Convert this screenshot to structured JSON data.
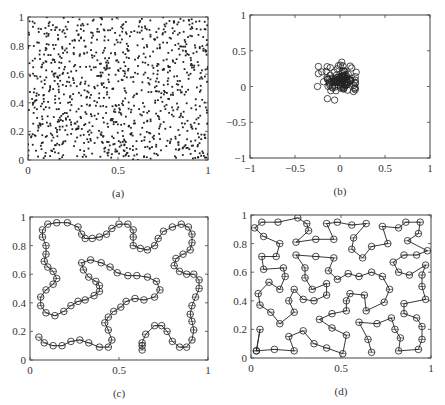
{
  "figure": {
    "background": "#ffffff",
    "ink": "#222222"
  },
  "chart_data": [
    {
      "id": "a",
      "type": "scatter",
      "caption": "(a)",
      "title": "",
      "xlabel": "",
      "ylabel": "",
      "xlim": [
        0,
        1
      ],
      "ylim": [
        0,
        1
      ],
      "xticks": [
        0,
        0.5,
        1
      ],
      "xtick_labels": [
        "0",
        "0.5",
        "1"
      ],
      "yticks": [
        0,
        0.2,
        0.4,
        0.6,
        0.8,
        1
      ],
      "ytick_labels": [
        "0",
        "0.2",
        "0.4",
        "0.6",
        "0.8",
        "1"
      ],
      "grid": false,
      "marker": "dot",
      "description": "Approximately 1000 points uniformly distributed over the unit square",
      "generator": {
        "kind": "uniform",
        "n": 1000,
        "seed": 7,
        "x_range": [
          0,
          1
        ],
        "y_range": [
          0,
          1
        ]
      },
      "frame": {
        "left": 28,
        "top": 17,
        "right": 208,
        "bottom": 160
      }
    },
    {
      "id": "b",
      "type": "scatter",
      "caption": "(b)",
      "title": "",
      "xlabel": "",
      "ylabel": "",
      "xlim": [
        -1,
        1
      ],
      "ylim": [
        -1,
        1
      ],
      "xticks": [
        -1,
        -0.5,
        0,
        0.5,
        1
      ],
      "xtick_labels": [
        "−1",
        "−0.5",
        "0",
        "0.5",
        "1"
      ],
      "yticks": [
        -1,
        -0.5,
        0,
        0.5,
        1
      ],
      "ytick_labels": [
        "−1",
        "−0.5",
        "0",
        "0.5",
        "1"
      ],
      "grid": false,
      "marker": "open-circle",
      "description": "About 100 open-circle points clustered near the origin within radius ~0.3",
      "generator": {
        "kind": "gaussian",
        "n": 100,
        "seed": 3,
        "center": [
          0.0,
          0.08
        ],
        "sigma": 0.09
      },
      "outliers": [
        [
          -0.24,
          0.28
        ],
        [
          -0.24,
          0.18
        ],
        [
          -0.25,
          0.0
        ],
        [
          -0.14,
          -0.17
        ],
        [
          -0.06,
          -0.19
        ],
        [
          0.02,
          0.34
        ],
        [
          0.18,
          0.2
        ],
        [
          0.15,
          -0.07
        ],
        [
          0.13,
          0.26
        ]
      ],
      "frame": {
        "left": 250,
        "top": 15,
        "right": 430,
        "bottom": 158
      }
    },
    {
      "id": "c",
      "type": "line",
      "caption": "(c)",
      "title": "",
      "xlabel": "",
      "ylabel": "",
      "xlim": [
        0,
        1
      ],
      "ylim": [
        0,
        1
      ],
      "xticks": [
        0,
        0.5,
        1
      ],
      "xtick_labels": [
        "0",
        "0.5",
        "1"
      ],
      "yticks": [
        0,
        0.2,
        0.4,
        0.6,
        0.8,
        1
      ],
      "ytick_labels": [
        "0",
        "0.2",
        "0.4",
        "0.6",
        "0.8",
        "1"
      ],
      "grid": false,
      "marker": "open-circle",
      "description": "Single open path (elastic ring / chain) of about 100 nodes winding through the unit square",
      "series": [
        {
          "name": "path",
          "points": [
            [
              0.63,
              0.07
            ],
            [
              0.63,
              0.1
            ],
            [
              0.63,
              0.12
            ],
            [
              0.65,
              0.18
            ],
            [
              0.7,
              0.24
            ],
            [
              0.74,
              0.24
            ],
            [
              0.77,
              0.2
            ],
            [
              0.8,
              0.13
            ],
            [
              0.84,
              0.09
            ],
            [
              0.88,
              0.09
            ],
            [
              0.91,
              0.14
            ],
            [
              0.92,
              0.21
            ],
            [
              0.91,
              0.27
            ],
            [
              0.9,
              0.32
            ],
            [
              0.91,
              0.38
            ],
            [
              0.93,
              0.44
            ],
            [
              0.95,
              0.5
            ],
            [
              0.95,
              0.56
            ],
            [
              0.92,
              0.6
            ],
            [
              0.88,
              0.6
            ],
            [
              0.84,
              0.62
            ],
            [
              0.81,
              0.66
            ],
            [
              0.82,
              0.71
            ],
            [
              0.86,
              0.74
            ],
            [
              0.9,
              0.77
            ],
            [
              0.91,
              0.82
            ],
            [
              0.91,
              0.88
            ],
            [
              0.89,
              0.93
            ],
            [
              0.85,
              0.95
            ],
            [
              0.8,
              0.93
            ],
            [
              0.75,
              0.9
            ],
            [
              0.72,
              0.85
            ],
            [
              0.7,
              0.8
            ],
            [
              0.66,
              0.77
            ],
            [
              0.62,
              0.78
            ],
            [
              0.58,
              0.8
            ],
            [
              0.58,
              0.86
            ],
            [
              0.58,
              0.91
            ],
            [
              0.55,
              0.95
            ],
            [
              0.5,
              0.95
            ],
            [
              0.46,
              0.92
            ],
            [
              0.43,
              0.88
            ],
            [
              0.39,
              0.86
            ],
            [
              0.35,
              0.85
            ],
            [
              0.31,
              0.85
            ],
            [
              0.29,
              0.88
            ],
            [
              0.27,
              0.93
            ],
            [
              0.21,
              0.96
            ],
            [
              0.15,
              0.96
            ],
            [
              0.1,
              0.95
            ],
            [
              0.07,
              0.91
            ],
            [
              0.07,
              0.86
            ],
            [
              0.09,
              0.8
            ],
            [
              0.09,
              0.74
            ],
            [
              0.08,
              0.69
            ],
            [
              0.1,
              0.65
            ],
            [
              0.13,
              0.62
            ],
            [
              0.15,
              0.57
            ],
            [
              0.13,
              0.53
            ],
            [
              0.09,
              0.49
            ],
            [
              0.06,
              0.44
            ],
            [
              0.06,
              0.38
            ],
            [
              0.09,
              0.33
            ],
            [
              0.14,
              0.31
            ],
            [
              0.19,
              0.34
            ],
            [
              0.23,
              0.38
            ],
            [
              0.27,
              0.41
            ],
            [
              0.31,
              0.42
            ],
            [
              0.36,
              0.45
            ],
            [
              0.39,
              0.48
            ],
            [
              0.39,
              0.52
            ],
            [
              0.37,
              0.55
            ],
            [
              0.33,
              0.58
            ],
            [
              0.3,
              0.63
            ],
            [
              0.29,
              0.68
            ],
            [
              0.34,
              0.7
            ],
            [
              0.4,
              0.68
            ],
            [
              0.45,
              0.65
            ],
            [
              0.49,
              0.61
            ],
            [
              0.55,
              0.59
            ],
            [
              0.6,
              0.59
            ],
            [
              0.66,
              0.58
            ],
            [
              0.71,
              0.55
            ],
            [
              0.73,
              0.49
            ],
            [
              0.7,
              0.44
            ],
            [
              0.64,
              0.42
            ],
            [
              0.59,
              0.43
            ],
            [
              0.54,
              0.41
            ],
            [
              0.51,
              0.37
            ],
            [
              0.47,
              0.34
            ],
            [
              0.44,
              0.3
            ],
            [
              0.42,
              0.26
            ],
            [
              0.44,
              0.21
            ],
            [
              0.46,
              0.14
            ],
            [
              0.44,
              0.09
            ],
            [
              0.39,
              0.09
            ],
            [
              0.33,
              0.12
            ],
            [
              0.28,
              0.14
            ],
            [
              0.23,
              0.13
            ],
            [
              0.18,
              0.1
            ],
            [
              0.13,
              0.1
            ],
            [
              0.08,
              0.12
            ],
            [
              0.05,
              0.16
            ]
          ]
        }
      ],
      "frame": {
        "left": 30,
        "top": 217,
        "right": 208,
        "bottom": 360
      }
    },
    {
      "id": "d",
      "type": "line",
      "caption": "(d)",
      "title": "",
      "xlabel": "",
      "ylabel": "",
      "xlim": [
        0,
        1
      ],
      "ylim": [
        0,
        1
      ],
      "xticks": [
        0,
        0.5,
        1
      ],
      "xtick_labels": [
        "0",
        "0.5",
        "1"
      ],
      "yticks": [
        0,
        0.2,
        0.4,
        0.6,
        0.8,
        1
      ],
      "ytick_labels": [
        "0",
        "0.2",
        "0.4",
        "0.6",
        "0.8",
        "1"
      ],
      "grid": false,
      "marker": "open-circle",
      "description": "Tour-like path connecting about 100 scattered city nodes across the unit square",
      "series": [
        {
          "name": "tour",
          "points": [
            [
              0.03,
              0.05
            ],
            [
              0.05,
              0.2
            ],
            [
              0.03,
              0.05
            ],
            [
              0.13,
              0.06
            ],
            [
              0.24,
              0.05
            ],
            [
              0.21,
              0.15
            ],
            [
              0.29,
              0.19
            ],
            [
              0.35,
              0.1
            ],
            [
              0.42,
              0.07
            ],
            [
              0.51,
              0.03
            ],
            [
              0.53,
              0.16
            ],
            [
              0.45,
              0.21
            ],
            [
              0.38,
              0.27
            ],
            [
              0.45,
              0.31
            ],
            [
              0.53,
              0.33
            ],
            [
              0.53,
              0.4
            ],
            [
              0.55,
              0.45
            ],
            [
              0.63,
              0.44
            ],
            [
              0.64,
              0.33
            ],
            [
              0.74,
              0.39
            ],
            [
              0.77,
              0.48
            ],
            [
              0.73,
              0.57
            ],
            [
              0.67,
              0.6
            ],
            [
              0.6,
              0.57
            ],
            [
              0.54,
              0.59
            ],
            [
              0.48,
              0.55
            ],
            [
              0.43,
              0.61
            ],
            [
              0.46,
              0.7
            ],
            [
              0.36,
              0.71
            ],
            [
              0.25,
              0.72
            ],
            [
              0.3,
              0.63
            ],
            [
              0.3,
              0.56
            ],
            [
              0.34,
              0.48
            ],
            [
              0.42,
              0.52
            ],
            [
              0.42,
              0.44
            ],
            [
              0.35,
              0.4
            ],
            [
              0.29,
              0.41
            ],
            [
              0.24,
              0.48
            ],
            [
              0.21,
              0.4
            ],
            [
              0.24,
              0.32
            ],
            [
              0.16,
              0.24
            ],
            [
              0.11,
              0.32
            ],
            [
              0.05,
              0.37
            ],
            [
              0.04,
              0.45
            ],
            [
              0.1,
              0.53
            ],
            [
              0.16,
              0.48
            ],
            [
              0.19,
              0.57
            ],
            [
              0.18,
              0.63
            ],
            [
              0.07,
              0.62
            ],
            [
              0.06,
              0.71
            ],
            [
              0.14,
              0.71
            ],
            [
              0.16,
              0.8
            ],
            [
              0.07,
              0.85
            ],
            [
              0.02,
              0.91
            ],
            [
              0.06,
              0.95
            ],
            [
              0.15,
              0.95
            ],
            [
              0.26,
              0.98
            ],
            [
              0.31,
              0.94
            ],
            [
              0.32,
              0.89
            ],
            [
              0.25,
              0.81
            ],
            [
              0.36,
              0.83
            ],
            [
              0.46,
              0.83
            ],
            [
              0.42,
              0.94
            ],
            [
              0.48,
              0.95
            ],
            [
              0.56,
              0.93
            ],
            [
              0.64,
              0.94
            ],
            [
              0.57,
              0.84
            ],
            [
              0.56,
              0.76
            ],
            [
              0.62,
              0.7
            ],
            [
              0.67,
              0.78
            ],
            [
              0.76,
              0.8
            ],
            [
              0.73,
              0.92
            ],
            [
              0.82,
              0.91
            ],
            [
              0.86,
              0.95
            ],
            [
              0.94,
              0.95
            ],
            [
              0.93,
              0.87
            ],
            [
              0.87,
              0.82
            ],
            [
              0.98,
              0.75
            ],
            [
              0.92,
              0.72
            ],
            [
              0.85,
              0.72
            ],
            [
              0.79,
              0.67
            ],
            [
              0.82,
              0.6
            ],
            [
              0.88,
              0.58
            ],
            [
              0.97,
              0.65
            ],
            [
              0.95,
              0.58
            ],
            [
              0.95,
              0.5
            ],
            [
              0.97,
              0.41
            ],
            [
              0.85,
              0.38
            ],
            [
              0.85,
              0.31
            ],
            [
              0.92,
              0.28
            ],
            [
              0.95,
              0.22
            ],
            [
              0.95,
              0.13
            ],
            [
              0.93,
              0.06
            ],
            [
              0.82,
              0.05
            ],
            [
              0.83,
              0.14
            ],
            [
              0.8,
              0.2
            ],
            [
              0.78,
              0.28
            ],
            [
              0.7,
              0.24
            ],
            [
              0.6,
              0.25
            ],
            [
              0.65,
              0.13
            ],
            [
              0.67,
              0.04
            ]
          ]
        }
      ],
      "frame": {
        "left": 251,
        "top": 215,
        "right": 431,
        "bottom": 358
      }
    }
  ]
}
